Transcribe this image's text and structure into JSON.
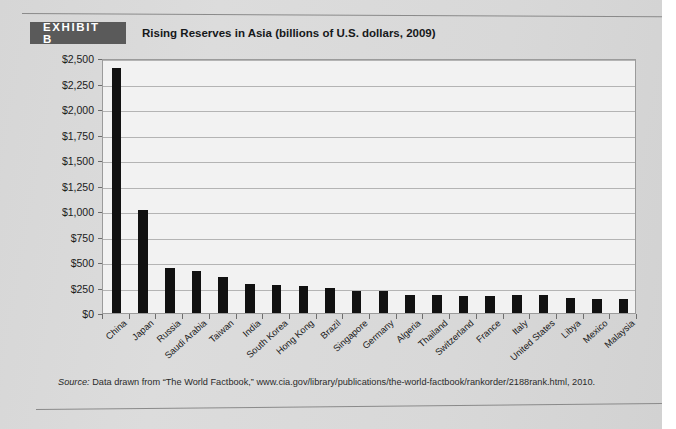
{
  "exhibit": {
    "tag": "EXHIBIT B",
    "title": "Rising Reserves in Asia (billions of U.S. dollars, 2009)"
  },
  "source": {
    "label": "Source:",
    "text": " Data drawn from “The World Factbook,” www.cia.gov/library/publications/the-world-factbook/rankorder/2188rank.html, 2010."
  },
  "colors": {
    "bar": "#111111",
    "plot_background": "#f2f2f2",
    "page_background": "#d9d9d9",
    "tag_background": "#5a5a5a",
    "gridline": "#b4b4b4"
  },
  "chart_data": {
    "type": "bar",
    "title": "Rising Reserves in Asia (billions of U.S. dollars, 2009)",
    "xlabel": "",
    "ylabel": "",
    "ylim": [
      0,
      2500
    ],
    "ytick_values": [
      0,
      250,
      500,
      750,
      1000,
      1250,
      1500,
      1750,
      2000,
      2250,
      2500
    ],
    "ytick_labels": [
      "$0",
      "$250",
      "$500",
      "$750",
      "$1,000",
      "$1,250",
      "$1,500",
      "$1,750",
      "$2,000",
      "$2,250",
      "$2,500"
    ],
    "grid": true,
    "legend": false,
    "categories": [
      "China",
      "Japan",
      "Russia",
      "Saudi Arabia",
      "Taiwan",
      "India",
      "South Korea",
      "Hong Kong",
      "Brazil",
      "Singapore",
      "Germany",
      "Algeria",
      "Thailand",
      "Switzerland",
      "France",
      "Italy",
      "United States",
      "Libya",
      "Mexico",
      "Malaysia"
    ],
    "values": [
      2400,
      1010,
      440,
      410,
      350,
      283,
      275,
      262,
      250,
      220,
      214,
      180,
      172,
      170,
      166,
      172,
      172,
      150,
      140,
      135
    ]
  }
}
